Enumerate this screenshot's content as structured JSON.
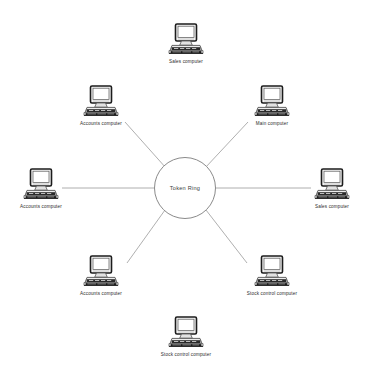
{
  "diagram": {
    "hub": {
      "label": "Token Ring",
      "icon": "ring-circle-icon",
      "cx": 185,
      "cy": 188,
      "r": 31,
      "stroke": "#8a8a8a"
    },
    "style": {
      "background": "#ffffff",
      "edge_color": "#9a9a9a",
      "icon_outline": "#555555",
      "icon_dark": "#1c1c1c",
      "icon_fill": "#f2f2f2",
      "label_color": "#2b2b2b"
    },
    "nodes": [
      {
        "id": "node-top",
        "label": "Sales computer",
        "icon": "desktop-computer-icon",
        "x": 186,
        "y": 40,
        "connected": false
      },
      {
        "id": "node-top-left",
        "label": "Accounts computer",
        "icon": "desktop-computer-icon",
        "x": 101,
        "y": 102,
        "connected": true,
        "edge_from": [
          125,
          122
        ],
        "edge_to": [
          166,
          168
        ]
      },
      {
        "id": "node-top-right",
        "label": "Main computer",
        "icon": "desktop-computer-icon",
        "x": 272,
        "y": 102,
        "connected": true,
        "edge_from": [
          248,
          122
        ],
        "edge_to": [
          205,
          168
        ]
      },
      {
        "id": "node-left",
        "label": "Accounts computer",
        "icon": "desktop-computer-icon",
        "x": 41,
        "y": 185,
        "connected": true,
        "edge_from": [
          62,
          188
        ],
        "edge_to": [
          154,
          188
        ]
      },
      {
        "id": "node-right",
        "label": "Sales computer",
        "icon": "desktop-computer-icon",
        "x": 332,
        "y": 185,
        "connected": true,
        "edge_from": [
          311,
          188
        ],
        "edge_to": [
          216,
          188
        ]
      },
      {
        "id": "node-bottom-left",
        "label": "Accounts computer",
        "icon": "desktop-computer-icon",
        "x": 101,
        "y": 272,
        "connected": true,
        "edge_from": [
          127,
          263
        ],
        "edge_to": [
          165,
          210
        ]
      },
      {
        "id": "node-bottom-right",
        "label": "Stock control computer",
        "icon": "desktop-computer-icon",
        "x": 272,
        "y": 272,
        "connected": true,
        "edge_from": [
          247,
          263
        ],
        "edge_to": [
          206,
          210
        ]
      },
      {
        "id": "node-bottom",
        "label": "Stock control computer",
        "icon": "desktop-computer-icon",
        "x": 186,
        "y": 333,
        "connected": false
      }
    ]
  }
}
